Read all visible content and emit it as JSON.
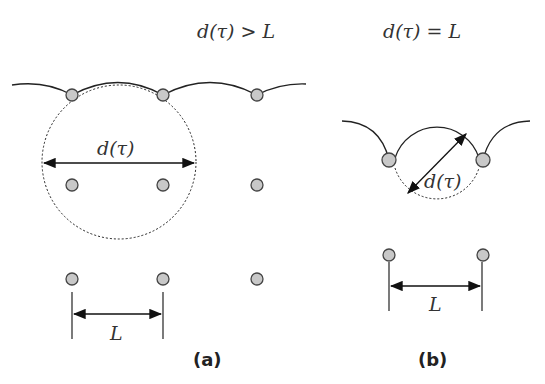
{
  "panel_a": {
    "title": "d(τ) > L",
    "diameter_label": "d(τ)",
    "spacing_label": "L",
    "caption": "(a)"
  },
  "panel_b": {
    "title": "d(τ) = L",
    "diameter_label": "d(τ)",
    "spacing_label": "L",
    "caption": "(b)"
  },
  "colors": {
    "node_fill": "#c8c8c8",
    "stroke": "#222222"
  }
}
